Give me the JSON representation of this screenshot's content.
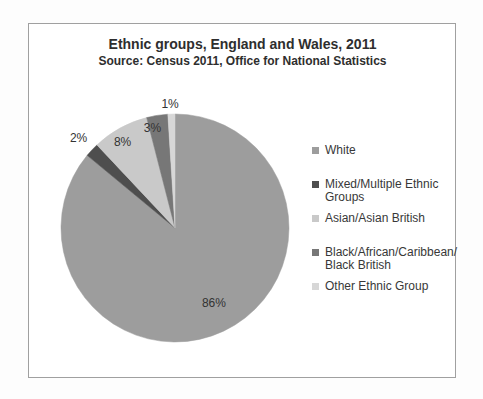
{
  "chart_data": {
    "type": "pie",
    "title": "Ethnic groups, England and Wales, 2011",
    "subtitle": "Source: Census 2011, Office for National Statistics",
    "direction": "clockwise",
    "start_angle_deg": 0,
    "legend_position": "right",
    "unit": "%",
    "slices": [
      {
        "label": "White",
        "value": 86,
        "data_label": "86%",
        "color": "#9d9d9d"
      },
      {
        "label": "Mixed/Multiple Ethnic Groups",
        "value": 2,
        "data_label": "2%",
        "color": "#4e4e4e"
      },
      {
        "label": "Asian/Asian British",
        "value": 8,
        "data_label": "8%",
        "color": "#c9c9c9"
      },
      {
        "label": "Black/African/Caribbean/Black British",
        "value": 3,
        "data_label": "3%",
        "color": "#777777"
      },
      {
        "label": "Other Ethnic Group",
        "value": 1,
        "data_label": "1%",
        "color": "#d7d7d7"
      }
    ],
    "legend_lines": [
      [
        "White"
      ],
      [
        "Mixed/Multiple Ethnic",
        "Groups"
      ],
      [
        "Asian/Asian British"
      ],
      [
        "Black/African/Caribbean/",
        "Black British"
      ],
      [
        "Other Ethnic Group"
      ]
    ]
  }
}
